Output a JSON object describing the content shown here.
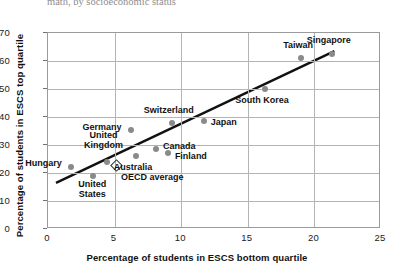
{
  "top_clipped_title": "math, by socioeconomic status",
  "axes": {
    "x_title": "Percentage of students in ESCS bottom quartile",
    "y_title": "Percentage of students in ESCS top quartile",
    "x_ticks": [
      "0",
      "5",
      "10",
      "15",
      "20",
      "25"
    ],
    "y_ticks": [
      "0",
      "10",
      "20",
      "30",
      "40",
      "50",
      "60",
      "70"
    ]
  },
  "colors": {
    "point": "#8a8a8a",
    "trendline": "#111111",
    "grid": "#b4b4b4",
    "frame": "#9a9a9a",
    "text": "#111111"
  },
  "chart_data": {
    "type": "scatter",
    "title": "math, by socioeconomic status",
    "xlabel": "Percentage of students in ESCS bottom quartile",
    "ylabel": "Percentage of students in ESCS top quartile",
    "xlim": [
      0,
      25
    ],
    "ylim": [
      0,
      70
    ],
    "xticks": [
      0,
      5,
      10,
      15,
      20,
      25
    ],
    "yticks": [
      0,
      10,
      20,
      30,
      40,
      50,
      60,
      70
    ],
    "grid": true,
    "legend": "none",
    "points": [
      {
        "label": "Hungary",
        "x": 1.7,
        "y": 22.0,
        "marker": "circle"
      },
      {
        "label": "United\nStates",
        "x": 3.4,
        "y": 19.0,
        "marker": "circle"
      },
      {
        "label": "United\nKingdom",
        "x": 4.4,
        "y": 24.0,
        "marker": "circle"
      },
      {
        "label": "OECD average",
        "x": 5.1,
        "y": 23.0,
        "marker": "diamond"
      },
      {
        "label": "Germany",
        "x": 6.2,
        "y": 35.5,
        "marker": "circle"
      },
      {
        "label": "Australia",
        "x": 6.6,
        "y": 26.0,
        "marker": "circle"
      },
      {
        "label": "Canada",
        "x": 8.1,
        "y": 28.5,
        "marker": "circle"
      },
      {
        "label": "Finland",
        "x": 9.0,
        "y": 27.0,
        "marker": "circle"
      },
      {
        "label": "Switzerland",
        "x": 9.3,
        "y": 38.0,
        "marker": "circle"
      },
      {
        "label": "Japan",
        "x": 11.7,
        "y": 38.5,
        "marker": "circle"
      },
      {
        "label": "South Korea",
        "x": 16.3,
        "y": 50.0,
        "marker": "circle"
      },
      {
        "label": "Taiwan",
        "x": 19.0,
        "y": 61.0,
        "marker": "circle"
      },
      {
        "label": "Singapore",
        "x": 21.3,
        "y": 62.5,
        "marker": "circle"
      }
    ],
    "trendline": {
      "x0": 0.6,
      "y0": 16.5,
      "x1": 21.5,
      "y1": 63.5
    }
  },
  "point_labels": {
    "hungary": "Hungary",
    "united_states": "United\nStates",
    "united_kingdom": "United\nKingdom",
    "oecd_average": "OECD average",
    "germany": "Germany",
    "australia": "Australia",
    "canada": "Canada",
    "finland": "Finland",
    "switzerland": "Switzerland",
    "japan": "Japan",
    "south_korea": "South Korea",
    "taiwan": "Taiwan",
    "singapore": "Singapore"
  }
}
